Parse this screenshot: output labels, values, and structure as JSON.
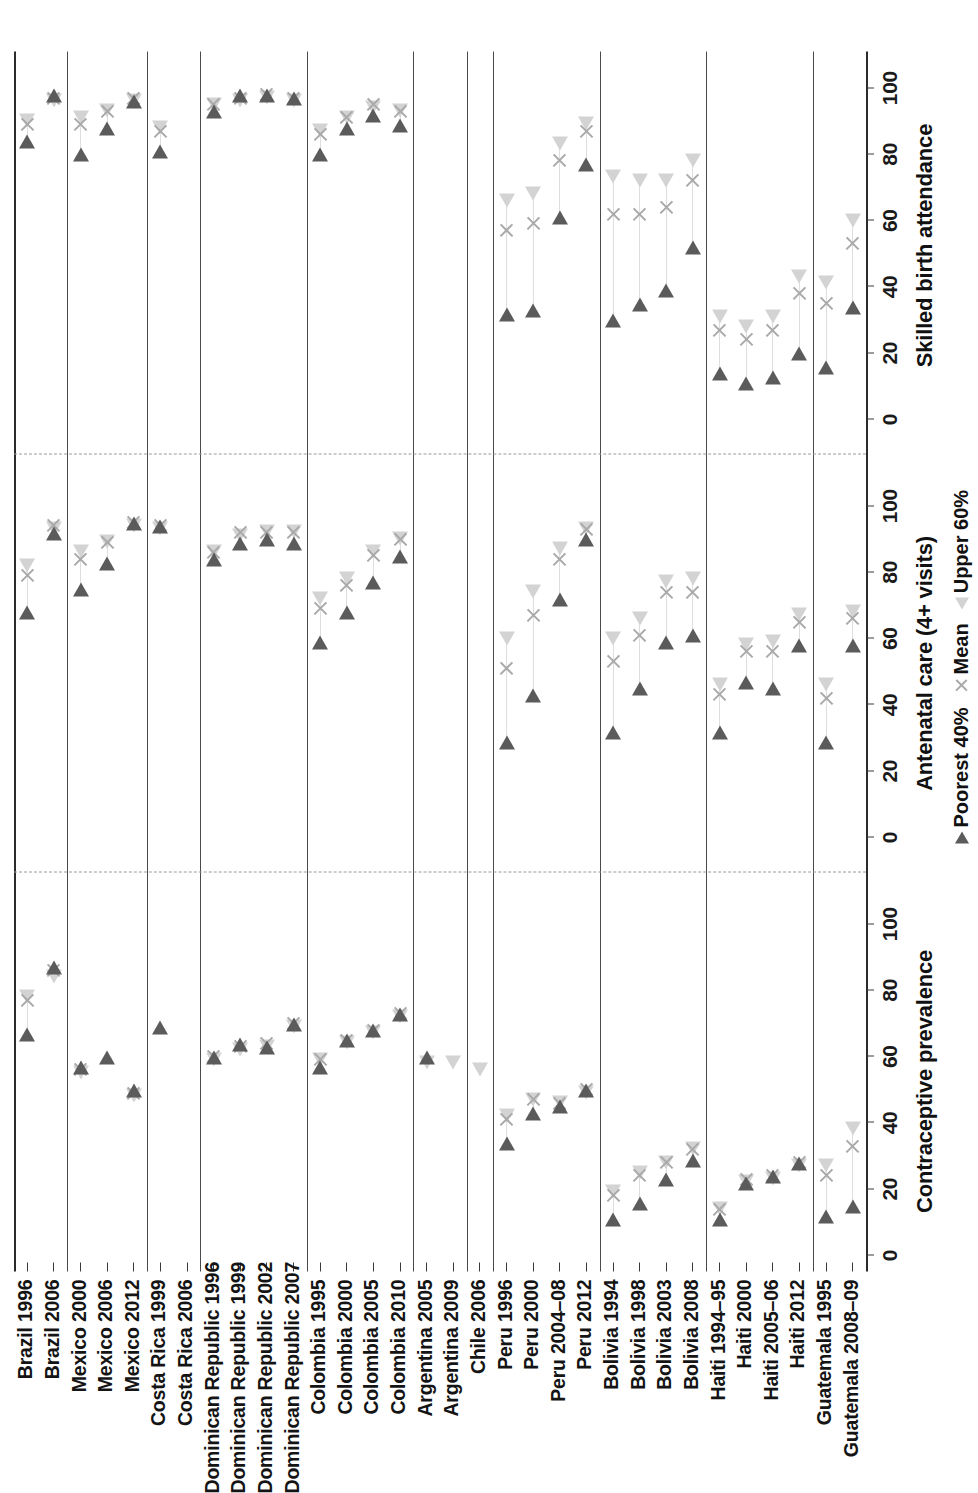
{
  "figure": {
    "orientation": "rotated-90-ccw",
    "legend": {
      "poorest_label": "Poorest 40%",
      "mean_label": "Mean",
      "upper_label": "Upper 60%",
      "poorest_color": "#5b5b5b",
      "mean_color": "#a9a9a9",
      "upper_color": "#d3d3d3"
    }
  },
  "chart_data": {
    "type": "scatter",
    "title": "",
    "xlabel": "",
    "ylabel": "",
    "grid": false,
    "legend_position": "bottom-right",
    "axis": {
      "ticks": [
        0,
        20,
        40,
        60,
        80,
        100
      ],
      "tick_labels": [
        "0",
        "20",
        "40",
        "60",
        "80",
        "100"
      ],
      "range": [
        0,
        105
      ]
    },
    "panels": [
      {
        "name": "Contraceptive prevalence"
      },
      {
        "name": "Antenatal care (4+ visits)"
      },
      {
        "name": "Skilled birth attendance"
      }
    ],
    "series": [
      {
        "name": "Poorest 40%",
        "marker": "triangle-dark"
      },
      {
        "name": "Mean",
        "marker": "x"
      },
      {
        "name": "Upper 60%",
        "marker": "triangle-light"
      }
    ],
    "groups": [
      {
        "country": "Brazil",
        "rows": [
          "Brazil 1996",
          "Brazil 2006"
        ]
      },
      {
        "country": "Mexico",
        "rows": [
          "Mexico 2000",
          "Mexico 2006",
          "Mexico 2012"
        ]
      },
      {
        "country": "Costa Rica",
        "rows": [
          "Costa Rica 1999",
          "Costa Rica 2006"
        ]
      },
      {
        "country": "Dominican Republic",
        "rows": [
          "Dominican Republic 1996",
          "Dominican Republic 1999",
          "Dominican Republic 2002",
          "Dominican Republic 2007"
        ]
      },
      {
        "country": "Colombia",
        "rows": [
          "Colombia 1995",
          "Colombia 2000",
          "Colombia 2005",
          "Colombia 2010"
        ]
      },
      {
        "country": "Argentina",
        "rows": [
          "Argentina 2005",
          "Argentina 2009"
        ]
      },
      {
        "country": "Chile",
        "rows": [
          "Chile 2006"
        ]
      },
      {
        "country": "Peru",
        "rows": [
          "Peru 1996",
          "Peru 2000",
          "Peru 2004–08",
          "Peru 2012"
        ]
      },
      {
        "country": "Bolivia",
        "rows": [
          "Bolivia 1994",
          "Bolivia 1998",
          "Bolivia 2003",
          "Bolivia 2008"
        ]
      },
      {
        "country": "Haiti",
        "rows": [
          "Haiti 1994–95",
          "Haiti 2000",
          "Haiti 2005–06",
          "Haiti 2012"
        ]
      },
      {
        "country": "Guatemala",
        "rows": [
          "Guatemala 1995",
          "Guatemala 2008–09"
        ]
      }
    ],
    "rows": [
      "Brazil 1996",
      "Brazil 2006",
      "Mexico 2000",
      "Mexico 2006",
      "Mexico 2012",
      "Costa Rica 1999",
      "Costa Rica 2006",
      "Dominican Republic 1996",
      "Dominican Republic 1999",
      "Dominican Republic 2002",
      "Dominican Republic 2007",
      "Colombia 1995",
      "Colombia 2000",
      "Colombia 2005",
      "Colombia 2010",
      "Argentina 2005",
      "Argentina 2009",
      "Chile 2006",
      "Peru 1996",
      "Peru 2000",
      "Peru 2004–08",
      "Peru 2012",
      "Bolivia 1994",
      "Bolivia 1998",
      "Bolivia 2003",
      "Bolivia 2008",
      "Haiti 1994–95",
      "Haiti 2000",
      "Haiti 2005–06",
      "Haiti 2012",
      "Guatemala 1995",
      "Guatemala 2008–09"
    ],
    "values": {
      "Contraceptive prevalence": {
        "Brazil 1996": {
          "poorest": 65,
          "mean": 77,
          "upper": 80
        },
        "Brazil 2006": {
          "poorest": 85,
          "mean": 86,
          "upper": 86
        },
        "Mexico 2000": {
          "poorest": 55,
          "mean": 56,
          "upper": 57
        },
        "Mexico 2006": {
          "poorest": 58,
          "mean": null,
          "upper": null
        },
        "Mexico 2012": {
          "poorest": 48,
          "mean": 49,
          "upper": 50
        },
        "Costa Rica 1999": {
          "poorest": 67,
          "mean": null,
          "upper": null
        },
        "Costa Rica 2006": {
          "poorest": null,
          "mean": null,
          "upper": null
        },
        "Dominican Republic 1996": {
          "poorest": 58,
          "mean": 60,
          "upper": 61
        },
        "Dominican Republic 1999": {
          "poorest": 62,
          "mean": 63,
          "upper": 64
        },
        "Dominican Republic 2002": {
          "poorest": 61,
          "mean": 64,
          "upper": 65
        },
        "Dominican Republic 2007": {
          "poorest": 68,
          "mean": 70,
          "upper": 71
        },
        "Colombia 1995": {
          "poorest": 55,
          "mean": 59,
          "upper": 61
        },
        "Colombia 2000": {
          "poorest": 63,
          "mean": 65,
          "upper": 66
        },
        "Colombia 2005": {
          "poorest": 66,
          "mean": 68,
          "upper": 69
        },
        "Colombia 2010": {
          "poorest": 71,
          "mean": 73,
          "upper": 74
        },
        "Argentina 2005": {
          "poorest": 58,
          "mean": null,
          "upper": 60
        },
        "Argentina 2009": {
          "poorest": null,
          "mean": null,
          "upper": 60
        },
        "Chile 2006": {
          "poorest": null,
          "mean": null,
          "upper": 58
        },
        "Peru 1996": {
          "poorest": 32,
          "mean": 41,
          "upper": 44
        },
        "Peru 2000": {
          "poorest": 41,
          "mean": 47,
          "upper": 49
        },
        "Peru 2004–08": {
          "poorest": 43,
          "mean": 46,
          "upper": 48
        },
        "Peru 2012": {
          "poorest": 48,
          "mean": 50,
          "upper": 51
        },
        "Bolivia 1994": {
          "poorest": 9,
          "mean": 18,
          "upper": 21
        },
        "Bolivia 1998": {
          "poorest": 14,
          "mean": 24,
          "upper": 27
        },
        "Bolivia 2003": {
          "poorest": 21,
          "mean": 28,
          "upper": 30
        },
        "Bolivia 2008": {
          "poorest": 27,
          "mean": 32,
          "upper": 34
        },
        "Haiti 1994–95": {
          "poorest": 9,
          "mean": 14,
          "upper": 16
        },
        "Haiti 2000": {
          "poorest": 20,
          "mean": 23,
          "upper": 24
        },
        "Haiti 2005–06": {
          "poorest": 22,
          "mean": 24,
          "upper": 25
        },
        "Haiti 2012": {
          "poorest": 26,
          "mean": 28,
          "upper": 29
        },
        "Guatemala 1995": {
          "poorest": 10,
          "mean": 24,
          "upper": 29
        },
        "Guatemala 2008–09": {
          "poorest": 13,
          "mean": 33,
          "upper": 40
        }
      },
      "Antenatal care (4+ visits)": {
        "Brazil 1996": {
          "poorest": 66,
          "mean": 79,
          "upper": 84
        },
        "Brazil 2006": {
          "poorest": 90,
          "mean": 94,
          "upper": 95
        },
        "Mexico 2000": {
          "poorest": 73,
          "mean": 84,
          "upper": 88
        },
        "Mexico 2006": {
          "poorest": 81,
          "mean": 89,
          "upper": 91
        },
        "Mexico 2012": {
          "poorest": 93,
          "mean": 95,
          "upper": 96
        },
        "Costa Rica 1999": {
          "poorest": 92,
          "mean": 94,
          "upper": 95
        },
        "Costa Rica 2006": {
          "poorest": null,
          "mean": null,
          "upper": null
        },
        "Dominican Republic 1996": {
          "poorest": 82,
          "mean": 86,
          "upper": 88
        },
        "Dominican Republic 1999": {
          "poorest": 87,
          "mean": 92,
          "upper": 93
        },
        "Dominican Republic 2002": {
          "poorest": 88,
          "mean": 92,
          "upper": 94
        },
        "Dominican Republic 2007": {
          "poorest": 87,
          "mean": 92,
          "upper": 94
        },
        "Colombia 1995": {
          "poorest": 57,
          "mean": 69,
          "upper": 74
        },
        "Colombia 2000": {
          "poorest": 66,
          "mean": 76,
          "upper": 80
        },
        "Colombia 2005": {
          "poorest": 75,
          "mean": 85,
          "upper": 88
        },
        "Colombia 2010": {
          "poorest": 83,
          "mean": 90,
          "upper": 92
        },
        "Argentina 2005": {
          "poorest": null,
          "mean": null,
          "upper": null
        },
        "Argentina 2009": {
          "poorest": null,
          "mean": null,
          "upper": null
        },
        "Chile 2006": {
          "poorest": null,
          "mean": null,
          "upper": null
        },
        "Peru 1996": {
          "poorest": 27,
          "mean": 51,
          "upper": 62
        },
        "Peru 2000": {
          "poorest": 41,
          "mean": 67,
          "upper": 76
        },
        "Peru 2004–08": {
          "poorest": 70,
          "mean": 84,
          "upper": 89
        },
        "Peru 2012": {
          "poorest": 88,
          "mean": 93,
          "upper": 95
        },
        "Bolivia 1994": {
          "poorest": 30,
          "mean": 53,
          "upper": 62
        },
        "Bolivia 1998": {
          "poorest": 43,
          "mean": 61,
          "upper": 68
        },
        "Bolivia 2003": {
          "poorest": 57,
          "mean": 74,
          "upper": 79
        },
        "Bolivia 2008": {
          "poorest": 59,
          "mean": 74,
          "upper": 80
        },
        "Haiti 1994–95": {
          "poorest": 30,
          "mean": 43,
          "upper": 48
        },
        "Haiti 2000": {
          "poorest": 45,
          "mean": 56,
          "upper": 60
        },
        "Haiti 2005–06": {
          "poorest": 43,
          "mean": 56,
          "upper": 61
        },
        "Haiti 2012": {
          "poorest": 56,
          "mean": 65,
          "upper": 69
        },
        "Guatemala 1995": {
          "poorest": 27,
          "mean": 42,
          "upper": 48
        },
        "Guatemala 2008–09": {
          "poorest": 56,
          "mean": 66,
          "upper": 70
        }
      },
      "Skilled birth attendance": {
        "Brazil 1996": {
          "poorest": 82,
          "mean": 89,
          "upper": 92
        },
        "Brazil 2006": {
          "poorest": 96,
          "mean": 97,
          "upper": 98
        },
        "Mexico 2000": {
          "poorest": 78,
          "mean": 89,
          "upper": 93
        },
        "Mexico 2006": {
          "poorest": 86,
          "mean": 93,
          "upper": 95
        },
        "Mexico 2012": {
          "poorest": 94,
          "mean": 97,
          "upper": 98
        },
        "Costa Rica 1999": {
          "poorest": 79,
          "mean": 87,
          "upper": 90
        },
        "Costa Rica 2006": {
          "poorest": null,
          "mean": null,
          "upper": null
        },
        "Dominican Republic 1996": {
          "poorest": 91,
          "mean": 95,
          "upper": 97
        },
        "Dominican Republic 1999": {
          "poorest": 96,
          "mean": 97,
          "upper": 98
        },
        "Dominican Republic 2002": {
          "poorest": 96,
          "mean": 98,
          "upper": 99
        },
        "Dominican Republic 2007": {
          "poorest": 95,
          "mean": 97,
          "upper": 98
        },
        "Colombia 1995": {
          "poorest": 78,
          "mean": 86,
          "upper": 89
        },
        "Colombia 2000": {
          "poorest": 86,
          "mean": 91,
          "upper": 93
        },
        "Colombia 2005": {
          "poorest": 90,
          "mean": 95,
          "upper": 96
        },
        "Colombia 2010": {
          "poorest": 87,
          "mean": 93,
          "upper": 95
        },
        "Argentina 2005": {
          "poorest": null,
          "mean": null,
          "upper": null
        },
        "Argentina 2009": {
          "poorest": null,
          "mean": null,
          "upper": null
        },
        "Chile 2006": {
          "poorest": null,
          "mean": null,
          "upper": null
        },
        "Peru 1996": {
          "poorest": 30,
          "mean": 57,
          "upper": 68
        },
        "Peru 2000": {
          "poorest": 31,
          "mean": 59,
          "upper": 70
        },
        "Peru 2004–08": {
          "poorest": 59,
          "mean": 78,
          "upper": 85
        },
        "Peru 2012": {
          "poorest": 75,
          "mean": 87,
          "upper": 91
        },
        "Bolivia 1994": {
          "poorest": 28,
          "mean": 62,
          "upper": 75
        },
        "Bolivia 1998": {
          "poorest": 33,
          "mean": 62,
          "upper": 74
        },
        "Bolivia 2003": {
          "poorest": 37,
          "mean": 64,
          "upper": 74
        },
        "Bolivia 2008": {
          "poorest": 50,
          "mean": 72,
          "upper": 80
        },
        "Haiti 1994–95": {
          "poorest": 12,
          "mean": 27,
          "upper": 33
        },
        "Haiti 2000": {
          "poorest": 9,
          "mean": 24,
          "upper": 30
        },
        "Haiti 2005–06": {
          "poorest": 11,
          "mean": 27,
          "upper": 33
        },
        "Haiti 2012": {
          "poorest": 18,
          "mean": 38,
          "upper": 45
        },
        "Guatemala 1995": {
          "poorest": 14,
          "mean": 35,
          "upper": 43
        },
        "Guatemala 2008–09": {
          "poorest": 32,
          "mean": 53,
          "upper": 62
        }
      }
    }
  }
}
